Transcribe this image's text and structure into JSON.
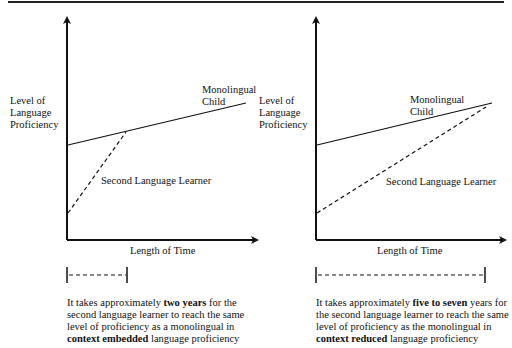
{
  "diagram": {
    "panels": [
      {
        "id": "context-embedded",
        "y_axis_label": [
          "Level of",
          "Language",
          "Proficiency"
        ],
        "x_axis_label": "Length of Time",
        "solid_line_label": [
          "Monolingual",
          "Child"
        ],
        "dashed_line_label": "Second Language Learner",
        "caption": {
          "pre": "It takes approximately ",
          "bold1": "two years",
          "mid": " for the second language learner to reach the same level of proficiency as a monolingual in ",
          "bold2": "context embedded",
          "post": " language proficiency"
        }
      },
      {
        "id": "context-reduced",
        "y_axis_label": [
          "Level of",
          "Language",
          "Proficiency"
        ],
        "x_axis_label": "Length of Time",
        "solid_line_label": [
          "Monolingual",
          "Child"
        ],
        "dashed_line_label": "Second Language Learner",
        "caption": {
          "pre": "It takes approximately ",
          "bold1": "five to seven",
          "mid": " years for the second language learner to reach the same level of proficiency as the monolingual in ",
          "bold2": "context reduced",
          "post": " language proficiency"
        }
      }
    ],
    "colors": {
      "line": "#111111",
      "background": "#ffffff"
    }
  }
}
